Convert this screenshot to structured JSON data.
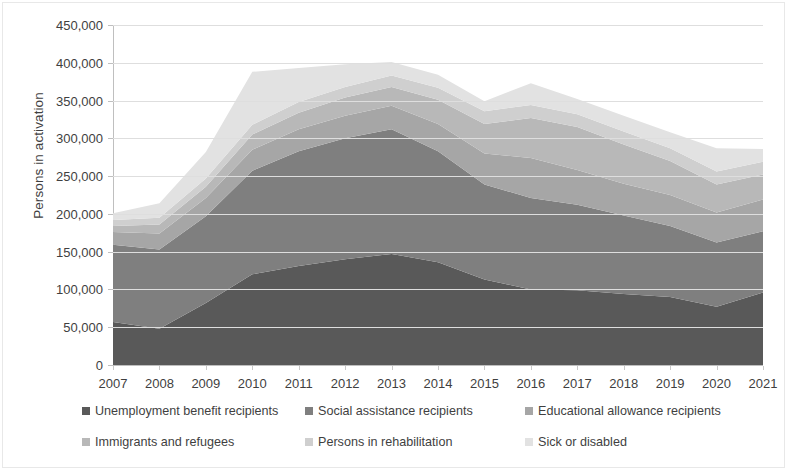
{
  "chart_data": {
    "type": "area",
    "stacked": true,
    "title": "",
    "xlabel": "",
    "ylabel": "Persons in activation",
    "categories": [
      2007,
      2008,
      2009,
      2010,
      2011,
      2012,
      2013,
      2014,
      2015,
      2016,
      2017,
      2018,
      2019,
      2020,
      2021
    ],
    "x_tick_labels": [
      "2007",
      "2008",
      "2009",
      "2010",
      "2011",
      "2012",
      "2013",
      "2014",
      "2015",
      "2016",
      "2017",
      "2018",
      "2019",
      "2020",
      "2021"
    ],
    "y_tick_labels": [
      "0",
      "50,000",
      "100,000",
      "150,000",
      "200,000",
      "250,000",
      "300,000",
      "350,000",
      "400,000",
      "450,000"
    ],
    "y_ticks": [
      0,
      50000,
      100000,
      150000,
      200000,
      250000,
      300000,
      350000,
      400000,
      450000
    ],
    "ylim": [
      0,
      450000
    ],
    "grid": true,
    "legend_position": "bottom",
    "series": [
      {
        "name": "Unemployment benefit recipients",
        "color": "#595959",
        "values": [
          57000,
          48000,
          82000,
          120000,
          131000,
          140000,
          147000,
          136000,
          113000,
          100000,
          99000,
          94000,
          90000,
          77000,
          96000
        ]
      },
      {
        "name": "Social assistance recipients",
        "color": "#7f7f7f",
        "values": [
          102000,
          105000,
          115000,
          137000,
          152000,
          160000,
          165000,
          147000,
          126000,
          121000,
          113000,
          104000,
          94000,
          85000,
          81000
        ]
      },
      {
        "name": "Educational allowance recipients",
        "color": "#a6a6a6",
        "values": [
          17000,
          21000,
          24000,
          28000,
          29000,
          30000,
          31000,
          36000,
          41000,
          53000,
          46000,
          42000,
          41000,
          40000,
          42000
        ]
      },
      {
        "name": "Immigrants and refugees",
        "color": "#b8b8b8",
        "values": [
          8000,
          12000,
          15000,
          20000,
          22000,
          24000,
          25000,
          32000,
          39000,
          53000,
          57000,
          52000,
          45000,
          37000,
          33000
        ]
      },
      {
        "name": "Persons in rehabilitation",
        "color": "#cfcfcf",
        "values": [
          8000,
          9000,
          11000,
          13000,
          14000,
          14000,
          15000,
          16000,
          17000,
          17000,
          17000,
          17000,
          17000,
          17000,
          17000
        ]
      },
      {
        "name": "Sick or disabled",
        "color": "#e2e2e2",
        "values": [
          9000,
          19000,
          35000,
          70000,
          45000,
          30000,
          18000,
          17000,
          13000,
          29000,
          20000,
          21000,
          21000,
          31000,
          17000
        ]
      }
    ],
    "series_totals": [
      201000,
      214000,
      282000,
      388000,
      393000,
      398000,
      401000,
      384000,
      349000,
      373000,
      352000,
      330000,
      308000,
      287000,
      286000
    ]
  },
  "axis": {
    "y_title": "Persons in activation"
  },
  "legend": {
    "items": [
      {
        "label": "Unemployment benefit recipients",
        "color": "#595959"
      },
      {
        "label": "Social assistance recipients",
        "color": "#7f7f7f"
      },
      {
        "label": "Educational allowance recipients",
        "color": "#a6a6a6"
      },
      {
        "label": "Immigrants and refugees",
        "color": "#b8b8b8"
      },
      {
        "label": "Persons in rehabilitation",
        "color": "#cfcfcf"
      },
      {
        "label": "Sick or disabled",
        "color": "#e2e2e2"
      }
    ]
  }
}
